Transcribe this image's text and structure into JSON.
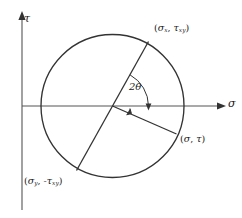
{
  "figure": {
    "name": "mohrs-circle-diagram",
    "background_color": "#ffffff",
    "stroke_color": "#333333",
    "text_color": "#1a1a1a"
  },
  "axes": {
    "vertical": {
      "icon": "arrow-up-icon",
      "label_tau": "τ",
      "x": 22,
      "y_top": 14,
      "y_bottom": 210
    },
    "horizontal": {
      "icon": "arrow-right-icon",
      "label_sigma": "σ",
      "y": 106,
      "x_left": 22,
      "x_right": 224
    }
  },
  "circle": {
    "center_x": 112.5,
    "center_y": 106,
    "radius": 71.5
  },
  "labels": {
    "point_x": {
      "open": "(",
      "sigma": "σ",
      "sigma_sub": "x",
      "comma": ", ",
      "tau": "τ",
      "tau_sub": "xy",
      "close": ")",
      "full": "(σx, τxy)"
    },
    "point_y": {
      "open": "(",
      "sigma": "σ",
      "sigma_sub": "y",
      "comma": ", ",
      "tau": "-τ",
      "tau_sub": "xy",
      "close": ")",
      "full": "(σy, -τxy)"
    },
    "point_st": {
      "open": "(",
      "sigma": "σ",
      "comma": ", ",
      "tau": "τ",
      "close": ")",
      "full": "(σ, τ)"
    },
    "angle": "2θ"
  },
  "lines": {
    "diameter": {
      "name": "principal-diameter-line",
      "x1": 148.5,
      "y1": 41.5,
      "x2": 76.5,
      "y2": 170.5
    },
    "radius_to_st": {
      "name": "radius-to-sigma-tau-line",
      "x1": 112.5,
      "y1": 106,
      "x2": 176,
      "y2": 134
    }
  },
  "angle_arc": {
    "name": "two-theta-arc",
    "start_deg": 0,
    "end_deg": 61,
    "radius": 36,
    "arrow": "arrowhead-down-icon"
  },
  "right_angle_mark": {
    "name": "right-angle-tick",
    "size": 6
  }
}
